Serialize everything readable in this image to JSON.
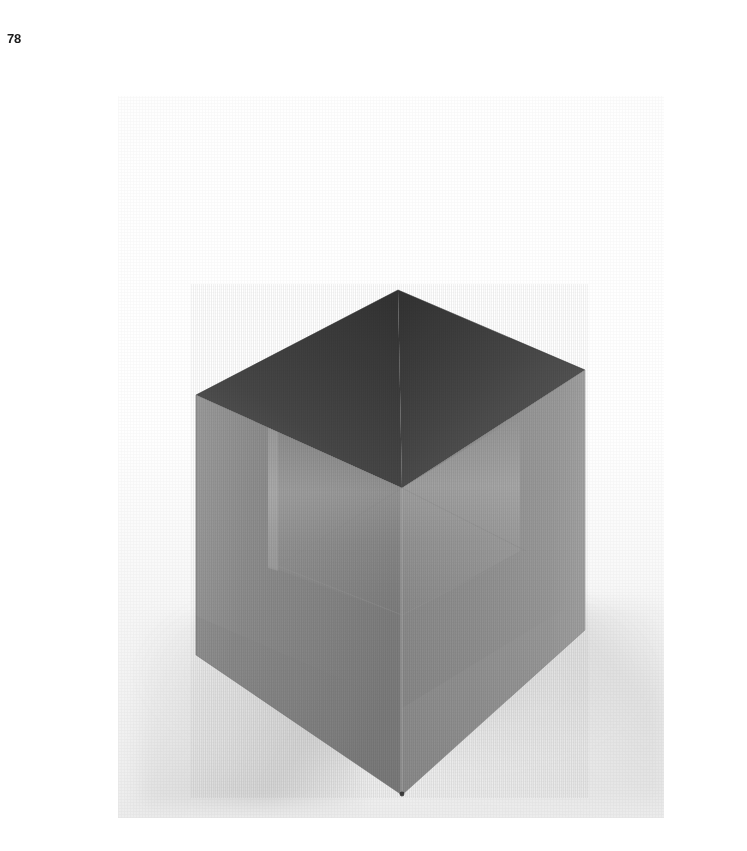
{
  "page": {
    "folio": "78",
    "background_color": "#ffffff",
    "width": 747,
    "height": 851
  },
  "plate": {
    "name": "cube-sculpture-photograph",
    "caption": "",
    "backdrop_color": "#f4f4f4",
    "bounds": {
      "left": 118,
      "top": 96,
      "width": 546,
      "height": 722
    }
  },
  "subject": {
    "description": "Open-topped cube / square tube sculpture photographed on a white seamless sweep, viewed from above a front corner",
    "material": "brushed metal",
    "faces": [
      {
        "name": "top-rim-back-left",
        "label": "top-rim-back-left",
        "color": "#3f3f3f"
      },
      {
        "name": "top-rim-back-right",
        "label": "top-rim-back-right",
        "color": "#4a4a4a"
      },
      {
        "name": "top-rim-front-left",
        "label": "top-rim-front-left",
        "color": "#5a5a5a"
      },
      {
        "name": "interior-floor",
        "label": "interior-floor",
        "color": "#c8c8c8"
      },
      {
        "name": "interior-wall-left",
        "label": "interior-wall-left",
        "color": "#a8a8a8"
      },
      {
        "name": "interior-wall-right",
        "label": "interior-wall-right",
        "color": "#b4b4b4"
      },
      {
        "name": "outer-face-left",
        "label": "outer-face-left",
        "color": "#8a8a8a"
      },
      {
        "name": "outer-face-right",
        "label": "outer-face-right",
        "color": "#919191"
      }
    ],
    "key_colors": {
      "darkest_top": "#3c3c3c",
      "left_face": "#8a8a8a",
      "right_face": "#919191",
      "interior_highlight": "#e6e6e6",
      "sweep_white": "#ffffff",
      "sweep_shadow": "#d8d8d8"
    },
    "geometry": {
      "top_vertex": [
        280,
        194
      ],
      "left_vertex": [
        78,
        299
      ],
      "right_vertex": [
        467,
        274
      ],
      "bottom_vertex": [
        284,
        699
      ],
      "left_bottom_corner": [
        78,
        559
      ],
      "right_bottom_corner": [
        467,
        534
      ],
      "inner_cavity_vertex": [
        284,
        392
      ]
    }
  }
}
